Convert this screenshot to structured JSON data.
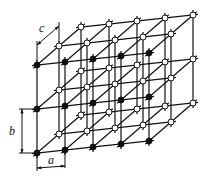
{
  "diagram": {
    "origin": [
      37,
      153
    ],
    "vec_a": [
      28,
      -3
    ],
    "vec_b": [
      0,
      -44
    ],
    "vec_c": [
      22,
      -19
    ],
    "count_a": 5,
    "count_b": 3,
    "count_c": 3,
    "front_node_color": "#111111",
    "back_node_color": "#ffffff",
    "line_color": "#111111",
    "labels": {
      "a": "a",
      "b": "b",
      "c": "c"
    }
  }
}
